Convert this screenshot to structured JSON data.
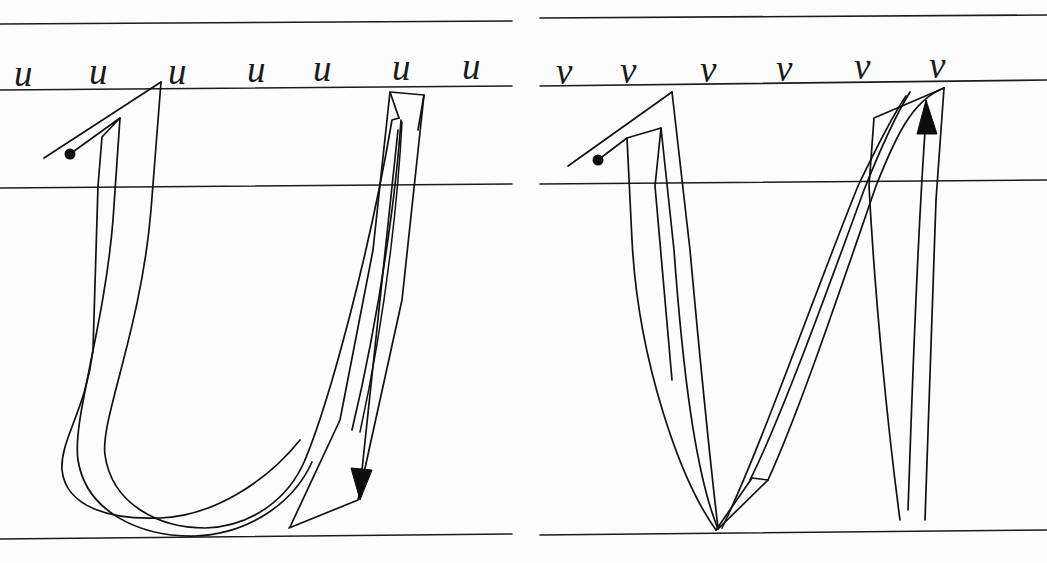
{
  "worksheet": {
    "title": "Cursive letter formation practice sheet",
    "ink_color": "#111111",
    "rule_color": "#1c1c1c",
    "paper_color": "#fdfdfd",
    "width": 1047,
    "height": 563
  },
  "panels": [
    {
      "id": "panel-u",
      "letter": "u",
      "model_row_label": "u u u u u u u",
      "model_letters": [
        "u",
        "u",
        "u",
        "u",
        "u",
        "u",
        "u"
      ],
      "model_count": 7,
      "stroke_direction": "down",
      "has_start_dot": true,
      "has_arrow": true,
      "arrow_direction": "down",
      "arrow_label": "downward stroke arrow"
    },
    {
      "id": "panel-v",
      "letter": "v",
      "model_row_label": "v v v v v v",
      "model_letters": [
        "v",
        "v",
        "v",
        "v",
        "v",
        "v"
      ],
      "model_count": 6,
      "stroke_direction": "up",
      "has_start_dot": true,
      "has_arrow": true,
      "arrow_direction": "up",
      "arrow_label": "upward stroke arrow"
    }
  ],
  "guidelines": {
    "count": 4,
    "names": [
      "ascender-line",
      "x-height-line",
      "midline",
      "baseline"
    ],
    "y_positions": [
      25,
      88,
      186,
      537
    ]
  }
}
